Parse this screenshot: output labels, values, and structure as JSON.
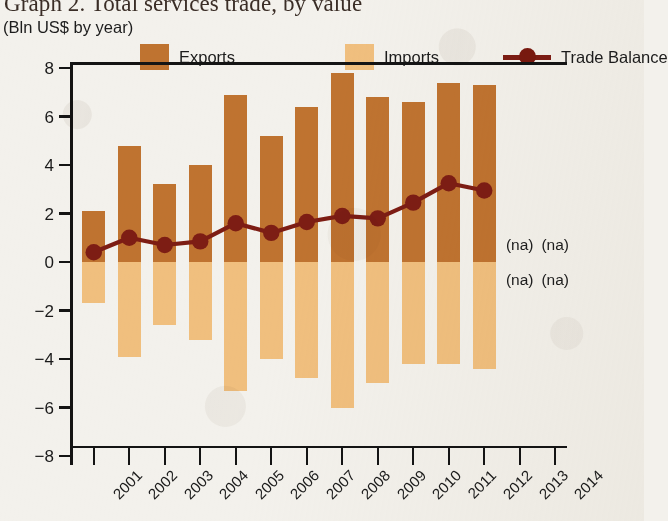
{
  "header": {
    "title": "Graph 2. Total services trade, by value",
    "subtitle": "(Bln US$ by year)"
  },
  "legend": {
    "exports": {
      "label": "Exports",
      "color": "#bf7330",
      "icon": "square-swatch-icon"
    },
    "imports": {
      "label": "Imports",
      "color": "#f0bf7e",
      "icon": "square-swatch-icon"
    },
    "balance": {
      "label": "Trade Balance",
      "color": "#7d1d14",
      "icon": "line-marker-icon"
    }
  },
  "annotations": {
    "na_text": "(na)",
    "items": [
      {
        "year": "2013",
        "position": "above-zero",
        "text": "(na)"
      },
      {
        "year": "2014",
        "position": "above-zero",
        "text": "(na)"
      },
      {
        "year": "2013",
        "position": "below-zero",
        "text": "(na)"
      },
      {
        "year": "2014",
        "position": "below-zero",
        "text": "(na)"
      }
    ]
  },
  "chart_data": {
    "type": "bar",
    "title": "Graph 2. Total services trade, by value",
    "subtitle": "(Bln US$ by year)",
    "xlabel": "",
    "ylabel": "Bln US$",
    "ylim": [
      -8,
      8
    ],
    "yticks": [
      8,
      6,
      4,
      2,
      0,
      -2,
      -4,
      -6,
      -8
    ],
    "ytick_labels": [
      "8",
      "6",
      "4",
      "2",
      "0",
      "−2",
      "−4",
      "−6",
      "−8"
    ],
    "grid": false,
    "legend_position": "top",
    "categories": [
      "2001",
      "2002",
      "2003",
      "2004",
      "2005",
      "2006",
      "2007",
      "2008",
      "2009",
      "2010",
      "2011",
      "2012",
      "2013",
      "2014"
    ],
    "series": [
      {
        "name": "Exports",
        "type": "bar",
        "color": "#bf7330",
        "values": [
          2.1,
          4.8,
          3.2,
          4.0,
          6.9,
          5.2,
          6.4,
          7.8,
          6.8,
          6.6,
          7.4,
          7.3,
          null,
          null
        ]
      },
      {
        "name": "Imports",
        "type": "bar",
        "color": "#f0bf7e",
        "values": [
          -1.7,
          -3.9,
          -2.6,
          -3.2,
          -5.3,
          -4.0,
          -4.8,
          -6.0,
          -5.0,
          -4.2,
          -4.2,
          -4.4,
          null,
          null
        ]
      },
      {
        "name": "Trade Balance",
        "type": "line",
        "color": "#7d1d14",
        "marker": "circle",
        "values": [
          0.4,
          1.0,
          0.7,
          0.85,
          1.6,
          1.2,
          1.65,
          1.9,
          1.8,
          2.45,
          3.25,
          2.95,
          null,
          null
        ]
      }
    ],
    "missing_label": "(na)",
    "missing_years": [
      "2013",
      "2014"
    ]
  }
}
